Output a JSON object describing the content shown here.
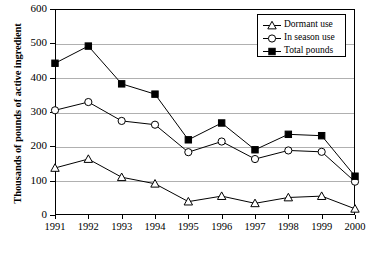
{
  "chart_data": {
    "type": "line",
    "title": "",
    "subtitle": "",
    "xlabel": "",
    "ylabel": "Thousands of pounds of active ingredient",
    "categories": [
      "1991",
      "1992",
      "1993",
      "1994",
      "1995",
      "1996",
      "1997",
      "1998",
      "1999",
      "2000"
    ],
    "x": [
      1991,
      1992,
      1993,
      1994,
      1995,
      1996,
      1997,
      1998,
      1999,
      2000
    ],
    "ylim": [
      0,
      600
    ],
    "yticks": [
      0,
      100,
      200,
      300,
      400,
      500,
      600
    ],
    "ytick_labels": [
      "0",
      "100",
      "200",
      "300",
      "400",
      "500",
      "600"
    ],
    "grid": "horizontal",
    "legend_position": "top-right",
    "series": [
      {
        "name": "Dormant use",
        "marker": "open-triangle",
        "color": "#000000",
        "values": [
          137,
          163,
          110,
          91,
          39,
          55,
          34,
          51,
          55,
          18
        ]
      },
      {
        "name": "In season use",
        "marker": "open-circle",
        "color": "#000000",
        "values": [
          305,
          329,
          274,
          263,
          183,
          214,
          163,
          188,
          184,
          97
        ]
      },
      {
        "name": "Total pounds",
        "marker": "filled-square",
        "color": "#000000",
        "values": [
          442,
          492,
          382,
          352,
          219,
          268,
          190,
          235,
          231,
          113
        ]
      }
    ]
  },
  "axis": {
    "y_title": "Thousands of pounds of active ingredient"
  },
  "legend": {
    "items": [
      {
        "label": "Dormant use",
        "marker": "open-triangle"
      },
      {
        "label": "In season use",
        "marker": "open-circle"
      },
      {
        "label": "Total pounds",
        "marker": "filled-square"
      }
    ]
  }
}
